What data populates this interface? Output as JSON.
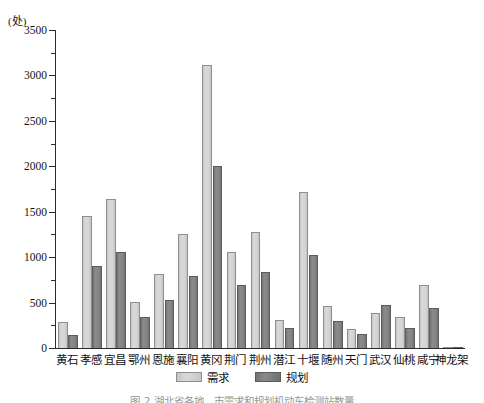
{
  "chart_data": {
    "type": "bar",
    "title": "",
    "unit_label": "(处)",
    "xlabel": "",
    "ylabel": "",
    "ylim": [
      0,
      3500
    ],
    "y_ticks": [
      0,
      500,
      1000,
      1500,
      2000,
      2500,
      3000,
      3500
    ],
    "y_tick_labels": [
      "0",
      "500",
      "1000",
      "1500",
      "2000",
      "2500",
      "3000",
      "3500"
    ],
    "y_minor_tick_step": 250,
    "grid": false,
    "legend_position": "bottom-center",
    "categories": [
      "黄石",
      "孝感",
      "宜昌",
      "鄂州",
      "恩施",
      "襄阳",
      "黄冈",
      "荆门",
      "荆州",
      "潜江",
      "十堰",
      "随州",
      "天门",
      "武汉",
      "仙桃",
      "咸宁",
      "神龙架"
    ],
    "series": [
      {
        "name": "需求",
        "color": "#d4d4d4",
        "values": [
          285,
          1455,
          1640,
          505,
          820,
          1250,
          3110,
          1055,
          1275,
          310,
          1720,
          460,
          205,
          385,
          340,
          690,
          5
        ]
      },
      {
        "name": "规划",
        "color": "#828282",
        "values": [
          145,
          905,
          1055,
          340,
          530,
          795,
          2005,
          690,
          840,
          225,
          1020,
          300,
          155,
          475,
          215,
          445,
          5
        ]
      }
    ]
  },
  "caption": {
    "text": "图 2 湖北省各地、市需求和规划机动车检测站数量"
  },
  "colors": {
    "axis": "#2b2b2b",
    "text": "#111111",
    "demand": "#d4d4d4",
    "plan": "#828282",
    "background": "#ffffff"
  }
}
